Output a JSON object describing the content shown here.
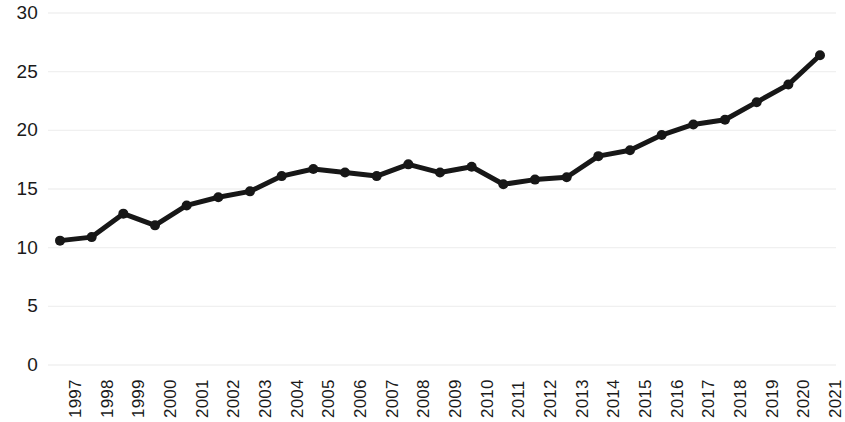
{
  "chart_data": {
    "type": "line",
    "title": "",
    "subtitle": "",
    "xlabel": "",
    "ylabel": "",
    "categories": [
      "1997",
      "1998",
      "1999",
      "2000",
      "2001",
      "2002",
      "2003",
      "2004",
      "2005",
      "2006",
      "2007",
      "2008",
      "2009",
      "2010",
      "2011",
      "2012",
      "2013",
      "2014",
      "2015",
      "2016",
      "2017",
      "2018",
      "2019",
      "2020",
      "2021"
    ],
    "values": [
      10.6,
      10.9,
      12.9,
      11.9,
      13.6,
      14.3,
      14.8,
      16.1,
      16.7,
      16.4,
      16.1,
      17.1,
      16.4,
      16.9,
      15.4,
      15.8,
      16.0,
      17.8,
      18.3,
      19.6,
      20.5,
      20.9,
      22.4,
      23.9,
      26.4
    ],
    "series": [
      {
        "name": "",
        "values": [
          10.6,
          10.9,
          12.9,
          11.9,
          13.6,
          14.3,
          14.8,
          16.1,
          16.7,
          16.4,
          16.1,
          17.1,
          16.4,
          16.9,
          15.4,
          15.8,
          16.0,
          17.8,
          18.3,
          19.6,
          20.5,
          20.9,
          22.4,
          23.9,
          26.4
        ],
        "color": "#171717",
        "marker": "circle"
      }
    ],
    "ylim": [
      0,
      30
    ],
    "yticks": [
      0,
      5,
      10,
      15,
      20,
      25,
      30
    ],
    "ytick_labels": [
      "0",
      "5",
      "10",
      "15",
      "20",
      "25",
      "30"
    ],
    "xtick_labels": [
      "1997",
      "1998",
      "1999",
      "2000",
      "2001",
      "2002",
      "2003",
      "2004",
      "2005",
      "2006",
      "2007",
      "2008",
      "2009",
      "2010",
      "2011",
      "2012",
      "2013",
      "2014",
      "2015",
      "2016",
      "2017",
      "2018",
      "2019",
      "2020",
      "2021"
    ],
    "xtick_rotation": -90,
    "grid": true,
    "grid_axis": "y",
    "grid_color": "#f0f0f0",
    "legend": false,
    "legend_position": "none",
    "line_width": 5,
    "marker_size": 10,
    "background_color": "#ffffff",
    "annotations": []
  },
  "geometry": {
    "plot_left": 60,
    "plot_right": 820,
    "y_zero_px": 365,
    "y_top_px": 13,
    "y_value_top": 30
  }
}
